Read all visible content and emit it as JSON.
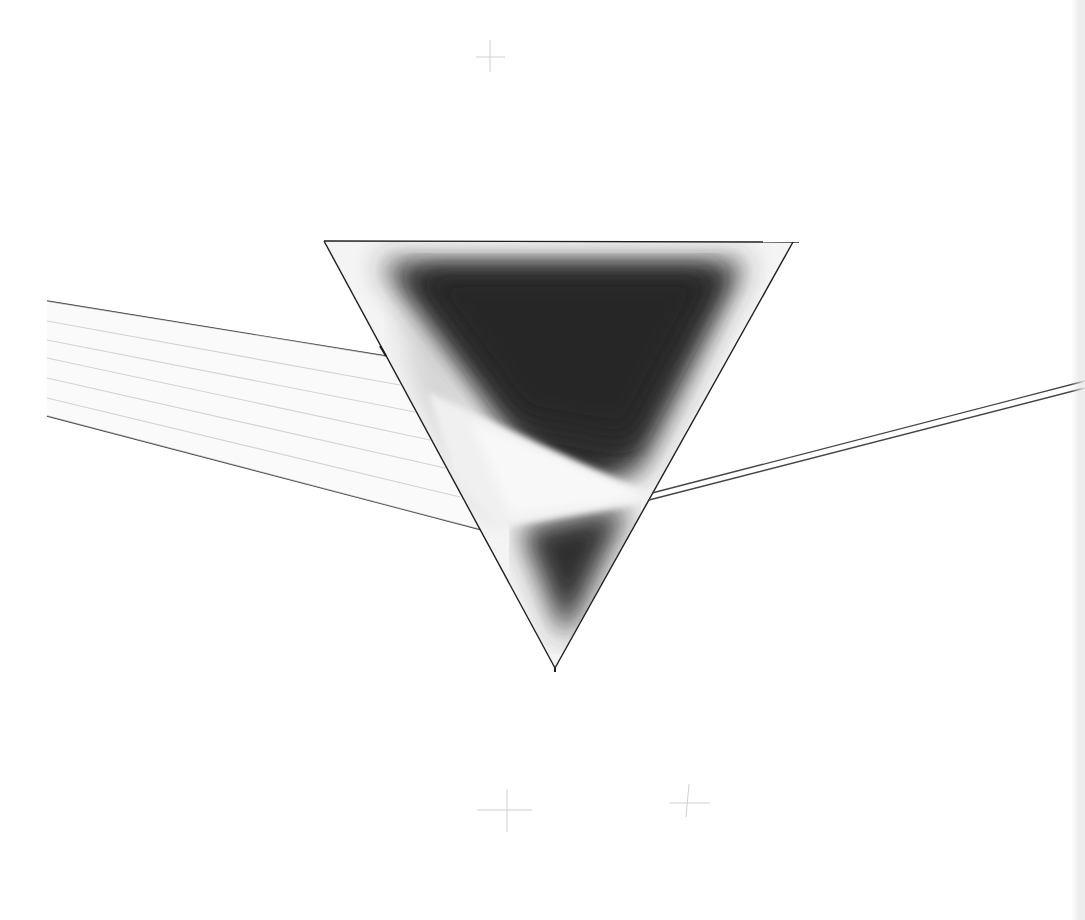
{
  "artwork": {
    "subject": "Prism refracting parallel light rays",
    "background_color": "#ffffff",
    "line_color": "#222222",
    "ray_color": "#9a9a9a",
    "prism_dark": "#2f2f2f",
    "prism_light": "#f2f2f2"
  },
  "prism": {
    "top_left": [
      324,
      241
    ],
    "top_right": [
      793,
      242
    ],
    "apex": [
      555,
      668
    ]
  },
  "incoming_rays": {
    "count": 7,
    "start_x": 47,
    "start_y": [
      301,
      321,
      340,
      358,
      378,
      398,
      416
    ],
    "end_points": [
      [
        386,
        356
      ],
      [
        400,
        385
      ],
      [
        415,
        412
      ],
      [
        430,
        440
      ],
      [
        445,
        468
      ],
      [
        460,
        497
      ],
      [
        482,
        530
      ]
    ]
  },
  "exit_beam": {
    "start": [
      650,
      497
    ],
    "end": [
      1085,
      385
    ],
    "style": "double-line"
  },
  "registration_marks": [
    {
      "x": 490,
      "y": 56
    },
    {
      "x": 508,
      "y": 810
    },
    {
      "x": 688,
      "y": 803
    }
  ]
}
